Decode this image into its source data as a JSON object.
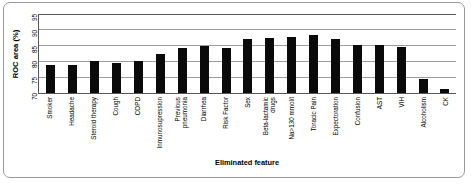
{
  "chart_data": {
    "type": "bar",
    "title": "",
    "xlabel": "Eliminated feature",
    "ylabel": "ROC area (%)",
    "ylim": [
      70,
      95
    ],
    "yticks": [
      70,
      75,
      80,
      85,
      90,
      95
    ],
    "grid": true,
    "legend": null,
    "bar_color": "#0a0a0a",
    "categories": [
      "Smoker",
      "Headache",
      "Steroid therapy",
      "Cough",
      "COPD",
      "Inmunosupression",
      "Previous pneumonia",
      "Diarrhea",
      "Risk Factor",
      "Sex",
      "Beta-lactamic drugs",
      "Na>130 mmol/l",
      "Toracic Pain",
      "Expectoration",
      "Confusion",
      "AST",
      "VIH",
      "Alcoholism",
      "CK"
    ],
    "categories_wrapped": [
      [
        "Smoker",
        ""
      ],
      [
        "Headache",
        ""
      ],
      [
        "Steroid therapy",
        ""
      ],
      [
        "Cough",
        ""
      ],
      [
        "COPD",
        ""
      ],
      [
        "Inmunosupression",
        ""
      ],
      [
        "Previous",
        "pneumonia"
      ],
      [
        "Diarrhea",
        ""
      ],
      [
        "Risk Factor",
        ""
      ],
      [
        "Sex",
        ""
      ],
      [
        "Beta-lactamic",
        "drugs"
      ],
      [
        "Na>130 mmol/l",
        ""
      ],
      [
        "Toracic Pain",
        ""
      ],
      [
        "Expectoration",
        ""
      ],
      [
        "Confusion",
        ""
      ],
      [
        "AST",
        ""
      ],
      [
        "VIH",
        ""
      ],
      [
        "Alcoholism",
        ""
      ],
      [
        "CK",
        ""
      ]
    ],
    "values": [
      78.8,
      78.8,
      80.2,
      79.5,
      80.2,
      82.5,
      84.3,
      85.0,
      84.1,
      87.0,
      87.3,
      87.6,
      88.3,
      87.1,
      85.2,
      85.2,
      84.5,
      74.5,
      71.4
    ]
  }
}
